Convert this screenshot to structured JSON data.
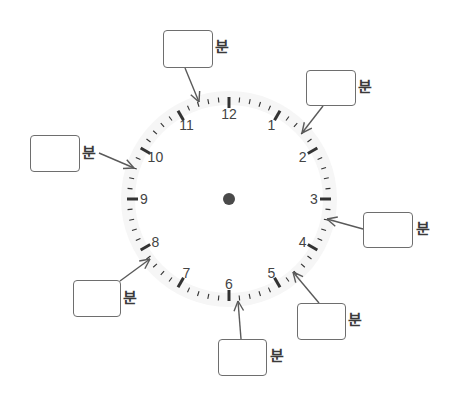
{
  "clock": {
    "center": [
      229,
      199
    ],
    "face_radius": 108,
    "tick_outer_radius": 102,
    "minor_tick_length": 5,
    "major_tick_length": 11,
    "numeral_radius": 85,
    "numerals": [
      "12",
      "1",
      "2",
      "3",
      "4",
      "5",
      "6",
      "7",
      "8",
      "9",
      "10",
      "11"
    ],
    "center_dot_radius": 6,
    "colors": {
      "ticks": "#333333",
      "numerals": "#444444",
      "dot": "#4a4a4a",
      "face": "#f6f6f6",
      "arrow": "#5a5a5a"
    }
  },
  "unit_label": "분",
  "questions": [
    {
      "id": "q-top",
      "box": [
        163,
        30,
        50,
        38
      ],
      "label_pos": [
        215,
        40
      ],
      "arrow_from": [
        185,
        68
      ],
      "arrow_to": [
        199,
        102
      ]
    },
    {
      "id": "q-upper-right",
      "box": [
        306,
        70,
        50,
        36
      ],
      "label_pos": [
        358,
        80
      ],
      "arrow_from": [
        323,
        106
      ],
      "arrow_to": [
        302,
        133
      ]
    },
    {
      "id": "q-left",
      "box": [
        30,
        135,
        50,
        37
      ],
      "label_pos": [
        82,
        146
      ],
      "arrow_from": [
        99,
        153
      ],
      "arrow_to": [
        134,
        168
      ]
    },
    {
      "id": "q-right",
      "box": [
        363,
        212,
        50,
        36
      ],
      "label_pos": [
        416,
        222
      ],
      "arrow_from": [
        363,
        229
      ],
      "arrow_to": [
        327,
        219
      ]
    },
    {
      "id": "q-lower-left",
      "box": [
        73,
        280,
        48,
        37
      ],
      "label_pos": [
        123,
        291
      ],
      "arrow_from": [
        120,
        281
      ],
      "arrow_to": [
        150,
        259
      ]
    },
    {
      "id": "q-lower-right",
      "box": [
        297,
        303,
        49,
        37
      ],
      "label_pos": [
        348,
        313
      ],
      "arrow_from": [
        319,
        303
      ],
      "arrow_to": [
        293,
        272
      ]
    },
    {
      "id": "q-bottom",
      "box": [
        218,
        339,
        49,
        37
      ],
      "label_pos": [
        270,
        349
      ],
      "arrow_from": [
        241,
        339
      ],
      "arrow_to": [
        238,
        301
      ]
    }
  ]
}
